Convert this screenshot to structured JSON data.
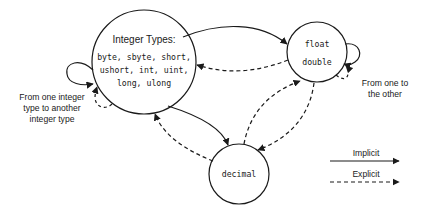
{
  "diagram": {
    "nodes": {
      "integer": {
        "heading": "Integer Types:",
        "lines": [
          "byte, sbyte, short,",
          "ushort, int, uint,",
          "long, ulong"
        ]
      },
      "floating": {
        "lines": [
          "float",
          "double"
        ]
      },
      "decimal": {
        "label": "decimal"
      }
    },
    "annotations": {
      "integer_self": [
        "From one integer",
        "type to another",
        "integer type"
      ],
      "float_self": [
        "From one to",
        "the other"
      ]
    },
    "legend": {
      "implicit": "Implicit",
      "explicit": "Explicit"
    },
    "edges": [
      {
        "from": "integer",
        "to": "floating",
        "style": "implicit"
      },
      {
        "from": "floating",
        "to": "integer",
        "style": "explicit"
      },
      {
        "from": "integer",
        "to": "decimal",
        "style": "implicit"
      },
      {
        "from": "decimal",
        "to": "integer",
        "style": "explicit"
      },
      {
        "from": "decimal",
        "to": "floating",
        "style": "explicit"
      },
      {
        "from": "floating",
        "to": "decimal",
        "style": "explicit"
      },
      {
        "from": "integer",
        "to": "integer",
        "style": "implicit"
      },
      {
        "from": "integer",
        "to": "integer",
        "style": "explicit"
      },
      {
        "from": "floating",
        "to": "floating",
        "style": "implicit"
      },
      {
        "from": "floating",
        "to": "floating",
        "style": "explicit"
      }
    ],
    "colors": {
      "stroke": "#1a1a1a",
      "background": "#ffffff"
    }
  }
}
